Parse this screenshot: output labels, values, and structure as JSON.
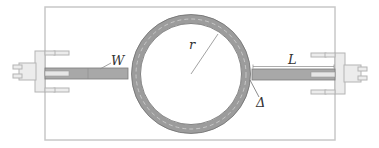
{
  "diagram": {
    "type": "ring-resonator-schematic",
    "labels": {
      "width": "W",
      "radius": "r",
      "length": "L",
      "gap": "Δ"
    },
    "colors": {
      "background": "#ffffff",
      "board_outline": "#c8c8c8",
      "trace_fill": "#a8a8a8",
      "trace_edge": "#7a7a7a",
      "ring_fill": "#9c9c9c",
      "ring_edge": "#6e6e6e",
      "ring_dash": "#d8d8d8",
      "connector_fill": "#ececec",
      "connector_edge": "#b4b4b4",
      "annotation_line": "#8a8a8a",
      "label_text": "#333333"
    }
  }
}
